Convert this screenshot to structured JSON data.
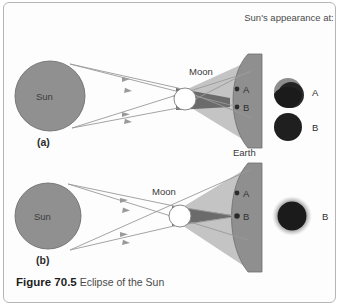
{
  "figure": {
    "number": "Figure 70.5",
    "title": "Eclipse of the Sun"
  },
  "legend_header": "Sun's appearance at:",
  "panels": [
    {
      "id": "a",
      "label": "(a)",
      "sun_label": "Sun",
      "moon_label": "Moon",
      "earth_label": "Earth",
      "point_a_label": "A",
      "point_b_label": "B",
      "appearance": [
        {
          "at": "A",
          "label": "A",
          "type": "partial"
        },
        {
          "at": "B",
          "label": "B",
          "type": "total-dark"
        }
      ]
    },
    {
      "id": "b",
      "label": "(b)",
      "sun_label": "Sun",
      "moon_label": "Moon",
      "point_a_label": "A",
      "point_b_label": "B",
      "appearance": [
        {
          "at": "B",
          "label": "B",
          "type": "total-corona"
        }
      ]
    }
  ],
  "colors": {
    "sun_fill": "#909090",
    "sun_stroke": "#6f6f6f",
    "earth_fill": "#8f8f8f",
    "earth_stroke": "#6e6e6e",
    "moon_fill": "#ffffff",
    "moon_stroke": "#7d7d7d",
    "penumbra": "#c4c4c4",
    "umbra": "#6b6b6b",
    "ray": "#9a9a9a",
    "disk_dark": "#1b1b1b",
    "disk_light": "#8d8d8d",
    "corona": "#9c9c9c",
    "border": "#b5b5b5",
    "text": "#3a3a3a"
  }
}
